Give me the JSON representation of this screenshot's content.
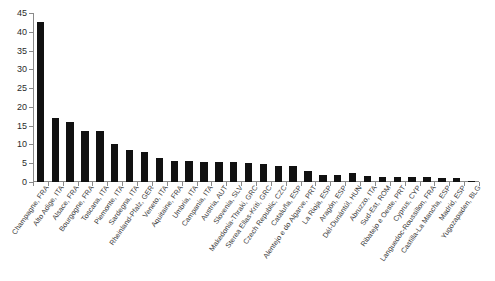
{
  "chart_data": {
    "type": "bar",
    "title": "",
    "subtitle": "",
    "xlabel": "",
    "ylabel": "",
    "ylim": [
      0,
      45
    ],
    "ytick_interval": 5,
    "grid": false,
    "legend": false,
    "bar_color": "#111111",
    "axis_color": "#8a8a8a",
    "categories": [
      "Champagne, FRA",
      "Alto Adige, ITA",
      "Alsace, FRA",
      "Bourgogne, FRA",
      "Toscana, ITA",
      "Piemonte, ITA",
      "Sardegna, ITA",
      "Rheinland-Pfalz, GER",
      "Veneto, ITA",
      "Aquitaine, FRA",
      "Umbria, ITA",
      "Campania, ITA",
      "Austria, AUT",
      "Slovenia, SLV",
      "Makedonia-Thraki, GRC",
      "Sterea Ellas-Kriti, GRC",
      "Czech Republic, CZC",
      "Cataluña, ESP",
      "Alentejo e do Algarve, PRT",
      "La Rioja, ESP",
      "Aragón, ESP",
      "Dél-Dunántúl, HUN",
      "Abruzzo, ITA",
      "Sud-Est, ROM",
      "Ribatejo e Oeste, PRT",
      "Cyprus, CYP",
      "Languedoc-Roussillon, FRA",
      "Castilla-La Mancha, ESP",
      "Madrid, ESP",
      "Yugozapaden, BLG"
    ],
    "values": [
      42.5,
      17.0,
      16.0,
      13.7,
      13.5,
      10.1,
      8.4,
      8.0,
      6.4,
      5.6,
      5.5,
      5.4,
      5.3,
      5.2,
      5.0,
      4.9,
      4.3,
      4.2,
      3.0,
      2.0,
      1.9,
      2.3,
      1.5,
      1.4,
      1.3,
      1.4,
      1.3,
      1.2,
      1.0,
      0.4
    ],
    "ytick_labels": [
      "0",
      "5",
      "10",
      "15",
      "20",
      "25",
      "30",
      "35",
      "40",
      "45"
    ],
    "ytick_values": [
      0,
      5,
      10,
      15,
      20,
      25,
      30,
      35,
      40,
      45
    ]
  }
}
